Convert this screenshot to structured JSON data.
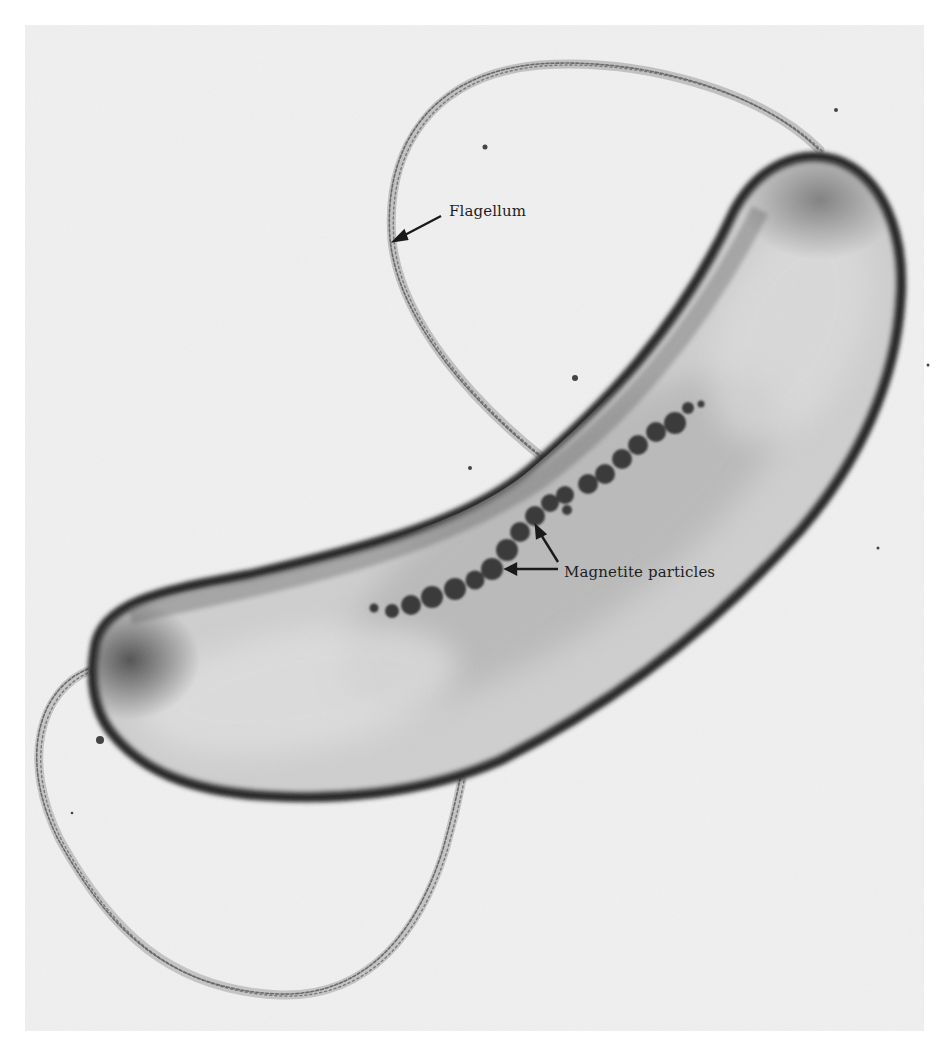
{
  "figure": {
    "background_color": "#ffffff",
    "panel_color": "#f1f1f1",
    "labels": [
      {
        "id": "flagellum",
        "text": "Flagellum"
      },
      {
        "id": "magnetite",
        "text": "Magnetite particles"
      }
    ],
    "annotations": {
      "flagellum": {
        "label": "Flagellum",
        "arrow_count": 1
      },
      "magnetite_particles": {
        "label": "Magnetite particles",
        "arrow_count": 2,
        "particle_count": 20
      }
    }
  }
}
